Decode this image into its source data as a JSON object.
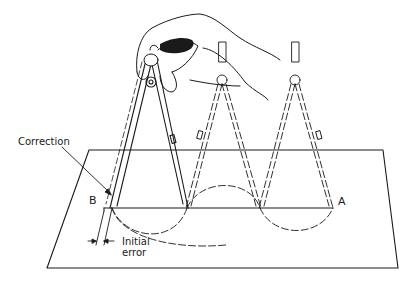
{
  "figure": {
    "colors": {
      "ink": "#1a1a1a",
      "background": "#ffffff"
    },
    "labels": {
      "correction": "Correction",
      "point_b": "B",
      "point_a": "A",
      "initial_error_line1": "Initial",
      "initial_error_line2": "error"
    },
    "elements": {
      "paper_sheet": "trapezoid drawing sheet in perspective",
      "baseline": "line from B to A",
      "divider_positions": 3,
      "step_arcs": 3
    }
  }
}
